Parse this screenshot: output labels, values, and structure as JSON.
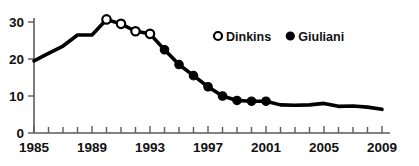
{
  "chart_data": {
    "type": "line",
    "title": "",
    "subtitle": "",
    "xlabel": "",
    "ylabel": "",
    "xlim": [
      1985,
      2009
    ],
    "ylim": [
      0,
      32
    ],
    "grid": false,
    "legend_position": "top-right",
    "x_tick_labels": [
      "1985",
      "1989",
      "1993",
      "1997",
      "2001",
      "2005",
      "2009"
    ],
    "x_major_ticks": [
      1985,
      1989,
      1993,
      1997,
      2001,
      2005,
      2009
    ],
    "x_minor_ticks": [
      1986,
      1987,
      1988,
      1990,
      1991,
      1992,
      1994,
      1995,
      1996,
      1998,
      1999,
      2000,
      2002,
      2003,
      2004,
      2006,
      2007,
      2008
    ],
    "y_tick_labels": [
      "0",
      "10",
      "20",
      "30"
    ],
    "y_ticks": [
      0,
      10,
      20,
      30
    ],
    "x": [
      1985,
      1986,
      1987,
      1988,
      1989,
      1990,
      1991,
      1992,
      1993,
      1994,
      1995,
      1996,
      1997,
      1998,
      1999,
      2000,
      2001,
      2002,
      2003,
      2004,
      2005,
      2006,
      2007,
      2008,
      2009
    ],
    "values": [
      19.5,
      21.5,
      23.5,
      26.5,
      26.5,
      30.7,
      29.5,
      27.5,
      26.8,
      22.5,
      18.5,
      15.5,
      12.5,
      10.0,
      8.8,
      8.6,
      8.6,
      7.6,
      7.5,
      7.6,
      8.0,
      7.2,
      7.3,
      7.0,
      6.4
    ],
    "series": [
      {
        "name": "Dinkins",
        "marker": "open-circle",
        "x": [
          1990,
          1991,
          1992,
          1993
        ],
        "values": [
          30.7,
          29.5,
          27.5,
          26.8
        ]
      },
      {
        "name": "Giuliani",
        "marker": "filled-circle",
        "x": [
          1994,
          1995,
          1996,
          1997,
          1998,
          1999,
          2000,
          2001
        ],
        "values": [
          22.5,
          18.5,
          15.5,
          12.5,
          10.0,
          8.8,
          8.6,
          8.6
        ]
      }
    ],
    "legend": [
      {
        "label": "Dinkins",
        "marker": "open-circle"
      },
      {
        "label": "Giuliani",
        "marker": "filled-circle"
      }
    ],
    "colors": {
      "line": "#000000",
      "axis": "#5a5a5a",
      "text": "#111111",
      "background": "#ffffff"
    }
  }
}
